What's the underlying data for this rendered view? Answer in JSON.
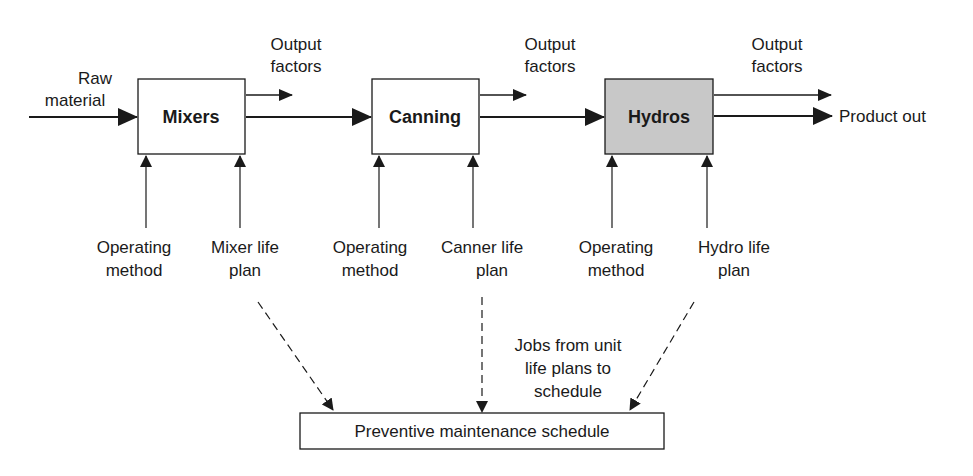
{
  "diagram": {
    "input": {
      "line1": "Raw",
      "line2": "material"
    },
    "units": [
      {
        "name": "Mixers",
        "fill": "#ffffff",
        "output": {
          "line1": "Output",
          "line2": "factors"
        },
        "inputs": [
          {
            "line1": "Operating",
            "line2": "method"
          },
          {
            "line1": "Mixer life",
            "line2": "plan"
          }
        ]
      },
      {
        "name": "Canning",
        "fill": "#ffffff",
        "output": {
          "line1": "Output",
          "line2": "factors"
        },
        "inputs": [
          {
            "line1": "Operating",
            "line2": "method"
          },
          {
            "line1": "Canner life",
            "line2": "plan"
          }
        ]
      },
      {
        "name": "Hydros",
        "fill": "#c8c8c8",
        "output": {
          "line1": "Output",
          "line2": "factors"
        },
        "inputs": [
          {
            "line1": "Operating",
            "line2": "method"
          },
          {
            "line1": "Hydro life",
            "line2": "plan"
          }
        ]
      }
    ],
    "product_out": "Product out",
    "jobs_note": {
      "line1": "Jobs from unit",
      "line2": "life plans to",
      "line3": "schedule"
    },
    "schedule": "Preventive maintenance schedule",
    "colors": {
      "stroke": "#1a1a1a",
      "hydros_fill": "#c8c8c8"
    }
  }
}
